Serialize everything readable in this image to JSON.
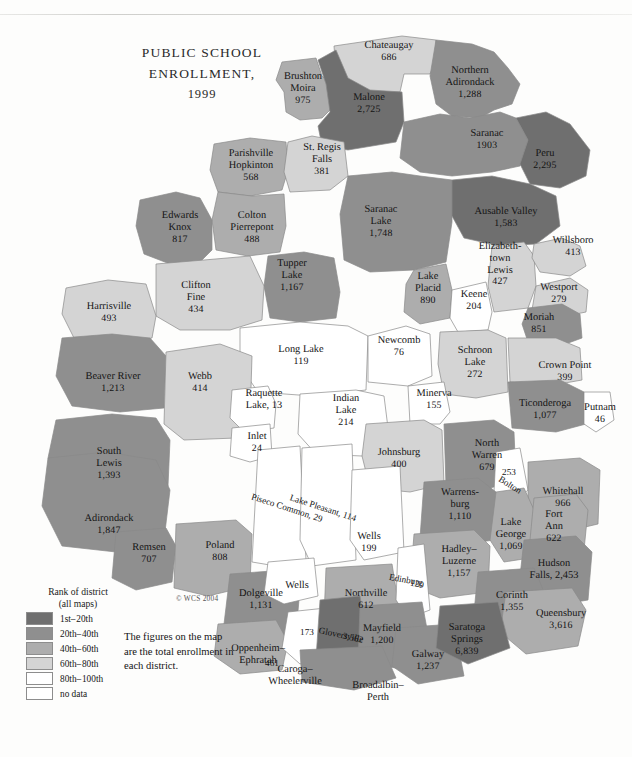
{
  "title": {
    "line1": "PUBLIC SCHOOL",
    "line2": "ENROLLMENT,",
    "line3": "1999"
  },
  "copyright": "© WCS 2004",
  "note": "The figures on the map are the total enrollment in each district.",
  "legend": {
    "title_line1": "Rank of district",
    "title_line2": "(all maps)",
    "items": [
      {
        "label": "1st– 20th",
        "color": "#6f6f6f"
      },
      {
        "label": "20th– 40th",
        "color": "#8f8f8f"
      },
      {
        "label": "40th– 60th",
        "color": "#adadad"
      },
      {
        "label": "60th– 80th",
        "color": "#d4d4d4"
      },
      {
        "label": "80th– 100th",
        "color": "#ffffff"
      },
      {
        "label": "no data",
        "color": "#ffffff"
      }
    ]
  },
  "chart_data": {
    "type": "map",
    "title": "PUBLIC SCHOOL ENROLLMENT, 1999",
    "units": "total enrollment in each district",
    "classes": [
      "1st–20th",
      "20th–40th",
      "40th–60th",
      "60th–80th",
      "80th–100th",
      "no data"
    ],
    "class_colors": [
      "#6f6f6f",
      "#8f8f8f",
      "#adadad",
      "#d4d4d4",
      "#ffffff",
      "#ffffff"
    ],
    "districts": [
      {
        "name": "Chateaugay",
        "value": "686",
        "class": 3
      },
      {
        "name": "Brushton\nMoira",
        "value": "975",
        "class": 2
      },
      {
        "name": "Malone",
        "value": "2,725",
        "class": 0
      },
      {
        "name": "Northern\nAdirondack",
        "value": "1,288",
        "class": 1
      },
      {
        "name": "Saranac",
        "value": "1903",
        "class": 1
      },
      {
        "name": "Peru",
        "value": "2,295",
        "class": 0
      },
      {
        "name": "Parishville\nHopkinton",
        "value": "568",
        "class": 2
      },
      {
        "name": "St. Regis\nFalls",
        "value": "381",
        "class": 3
      },
      {
        "name": "Saranac\nLake",
        "value": "1,748",
        "class": 1
      },
      {
        "name": "Ausable Valley",
        "value": "1,583",
        "class": 0
      },
      {
        "name": "Willsboro",
        "value": "413",
        "class": 3
      },
      {
        "name": "Edwards\nKnox",
        "value": "817",
        "class": 1
      },
      {
        "name": "Colton\nPierrepont",
        "value": "488",
        "class": 2
      },
      {
        "name": "Elizabeth-\ntown\nLewis",
        "value": "427",
        "class": 3
      },
      {
        "name": "Westport",
        "value": "279",
        "class": 3
      },
      {
        "name": "Tupper\nLake",
        "value": "1,167",
        "class": 1
      },
      {
        "name": "Lake\nPlacid",
        "value": "890",
        "class": 2
      },
      {
        "name": "Keene",
        "value": "204",
        "class": 4
      },
      {
        "name": "Harrisville",
        "value": "493",
        "class": 3
      },
      {
        "name": "Clifton\nFine",
        "value": "434",
        "class": 3
      },
      {
        "name": "Moriah",
        "value": "851",
        "class": 1
      },
      {
        "name": "Long Lake",
        "value": "119",
        "class": 4
      },
      {
        "name": "Newcomb",
        "value": "76",
        "class": 4
      },
      {
        "name": "Schroon\nLake",
        "value": "272",
        "class": 3
      },
      {
        "name": "Crown Point",
        "value": "399",
        "class": 3
      },
      {
        "name": "Beaver River",
        "value": "1,213",
        "class": 1
      },
      {
        "name": "Webb",
        "value": "414",
        "class": 3
      },
      {
        "name": "Raquette\nLake, 13",
        "value": "",
        "class": 4
      },
      {
        "name": "Indian\nLake",
        "value": "214",
        "class": 4
      },
      {
        "name": "Minerva",
        "value": "155",
        "class": 4
      },
      {
        "name": "Ticonderoga",
        "value": "1,077",
        "class": 1
      },
      {
        "name": "Putnam",
        "value": "46",
        "class": 4
      },
      {
        "name": "Inlet",
        "value": "24",
        "class": 4
      },
      {
        "name": "South\nLewis",
        "value": "1,393",
        "class": 1
      },
      {
        "name": "Johnsburg",
        "value": "400",
        "class": 3
      },
      {
        "name": "North\nWarren",
        "value": "679",
        "class": 1
      },
      {
        "name": "Bolton",
        "value": "253",
        "class": 4
      },
      {
        "name": "Whitehall",
        "value": "966",
        "class": 2
      },
      {
        "name": "Piseco Common, 29",
        "value": "",
        "class": 4
      },
      {
        "name": "Lake Pleasant, 114",
        "value": "",
        "class": 4
      },
      {
        "name": "Warrens-\nburg",
        "value": "1,110",
        "class": 1
      },
      {
        "name": "Lake\nGeorge",
        "value": "1,069",
        "class": 2
      },
      {
        "name": "Fort\nAnn",
        "value": "622",
        "class": 2
      },
      {
        "name": "Adirondack",
        "value": "1,847",
        "class": 1
      },
      {
        "name": "Remsen",
        "value": "707",
        "class": 1
      },
      {
        "name": "Poland",
        "value": "808",
        "class": 2
      },
      {
        "name": "Wells",
        "value": "199",
        "class": 4
      },
      {
        "name": "Hadley–\nLuzerne",
        "value": "1,157",
        "class": 2
      },
      {
        "name": "Hudson\nFalls, 2,453",
        "value": "",
        "class": 1
      },
      {
        "name": "Wells",
        "value": "",
        "class": 4
      },
      {
        "name": "Dolgeville",
        "value": "1,131",
        "class": 1
      },
      {
        "name": "Northville",
        "value": "612",
        "class": 2
      },
      {
        "name": "Edinburg",
        "value": "120",
        "class": 4
      },
      {
        "name": "Corinth",
        "value": "1,355",
        "class": 1
      },
      {
        "name": "Queensbury",
        "value": "3,616",
        "class": 2
      },
      {
        "name": "Oppenheim–\nEphratah",
        "value": "461",
        "class": 2
      },
      {
        "name": "Caroga–\nWheelerville",
        "value": "173",
        "class": 4
      },
      {
        "name": "Gloversville",
        "value": "3,562",
        "class": 0
      },
      {
        "name": "Mayfield",
        "value": "1,200",
        "class": 1
      },
      {
        "name": "Broadalbin–\nPerth",
        "value": "1,872",
        "class": 1
      },
      {
        "name": "Galway",
        "value": "1,237",
        "class": 1
      },
      {
        "name": "Saratoga\nSprings",
        "value": "6,839",
        "class": 0
      }
    ]
  },
  "labels": [
    {
      "name": "chateaugay",
      "x": 389,
      "y": 52,
      "t": "Chateaugay",
      "n": "686"
    },
    {
      "name": "brushton-moira",
      "x": 303,
      "y": 89,
      "t": "Brushton\nMoira",
      "n": "975"
    },
    {
      "name": "malone",
      "x": 369,
      "y": 104,
      "t": "Malone",
      "n": "2,725"
    },
    {
      "name": "northern-adirondack",
      "x": 470,
      "y": 83,
      "t": "Northern\nAdirondack",
      "n": "1,288"
    },
    {
      "name": "saranac",
      "x": 487,
      "y": 140,
      "t": "Saranac",
      "n": "1903"
    },
    {
      "name": "peru",
      "x": 545,
      "y": 160,
      "t": "Peru",
      "n": "2,295"
    },
    {
      "name": "parishville-hopkinton",
      "x": 251,
      "y": 166,
      "t": "Parishville\nHopkinton",
      "n": "568"
    },
    {
      "name": "st-regis-falls",
      "x": 322,
      "y": 160,
      "t": "St. Regis\nFalls",
      "n": "381"
    },
    {
      "name": "edwards-knox",
      "x": 180,
      "y": 228,
      "t": "Edwards\nKnox",
      "n": "817"
    },
    {
      "name": "colton-pierrepont",
      "x": 252,
      "y": 228,
      "t": "Colton\nPierrepont",
      "n": "488"
    },
    {
      "name": "saranac-lake",
      "x": 381,
      "y": 222,
      "t": "Saranac\nLake",
      "n": "1,748"
    },
    {
      "name": "ausable-valley",
      "x": 506,
      "y": 218,
      "t": "Ausable Valley",
      "n": "1,583"
    },
    {
      "name": "willsboro",
      "x": 573,
      "y": 247,
      "t": "Willsboro",
      "n": "413"
    },
    {
      "name": "elizabethtown-lewis",
      "x": 500,
      "y": 265,
      "t": "Elizabeth-\ntown\nLewis",
      "n": "427"
    },
    {
      "name": "westport",
      "x": 559,
      "y": 294,
      "t": "Westport",
      "n": "279"
    },
    {
      "name": "tupper-lake",
      "x": 292,
      "y": 276,
      "t": "Tupper\nLake",
      "n": "1,167"
    },
    {
      "name": "lake-placid",
      "x": 428,
      "y": 289,
      "t": "Lake\nPlacid",
      "n": "890"
    },
    {
      "name": "keene",
      "x": 474,
      "y": 301,
      "t": "Keene",
      "n": "204"
    },
    {
      "name": "harrisville",
      "x": 109,
      "y": 313,
      "t": "Harrisville",
      "n": "493"
    },
    {
      "name": "clifton-fine",
      "x": 196,
      "y": 298,
      "t": "Clifton\nFine",
      "n": "434"
    },
    {
      "name": "moriah",
      "x": 539,
      "y": 324,
      "t": "Moriah",
      "n": "851"
    },
    {
      "name": "long-lake",
      "x": 301,
      "y": 356,
      "t": "Long Lake",
      "n": "119"
    },
    {
      "name": "newcomb",
      "x": 399,
      "y": 347,
      "t": "Newcomb",
      "n": "76"
    },
    {
      "name": "schroon-lake",
      "x": 475,
      "y": 363,
      "t": "Schroon\nLake",
      "n": "272"
    },
    {
      "name": "crown-point",
      "x": 565,
      "y": 372,
      "t": "Crown Point",
      "n": "399"
    },
    {
      "name": "beaver-river",
      "x": 113,
      "y": 383,
      "t": "Beaver River",
      "n": "1,213"
    },
    {
      "name": "webb",
      "x": 200,
      "y": 383,
      "t": "Webb",
      "n": "414"
    },
    {
      "name": "raquette-lake",
      "x": 264,
      "y": 400,
      "t": "Raquette\nLake, 13",
      "n": ""
    },
    {
      "name": "indian-lake",
      "x": 346,
      "y": 411,
      "t": "Indian\nLake",
      "n": "214"
    },
    {
      "name": "minerva",
      "x": 434,
      "y": 400,
      "t": "Minerva",
      "n": "155"
    },
    {
      "name": "ticonderoga",
      "x": 545,
      "y": 410,
      "t": "Ticonderoga",
      "n": "1,077"
    },
    {
      "name": "putnam",
      "x": 600,
      "y": 414,
      "t": "Putnam",
      "n": "46"
    },
    {
      "name": "inlet",
      "x": 257,
      "y": 443,
      "t": "Inlet",
      "n": "24"
    },
    {
      "name": "south-lewis",
      "x": 109,
      "y": 464,
      "t": "South\nLewis",
      "n": "1,393"
    },
    {
      "name": "johnsburg",
      "x": 399,
      "y": 459,
      "t": "Johnsburg",
      "n": "400"
    },
    {
      "name": "north-warren",
      "x": 487,
      "y": 456,
      "t": "North\nWarren",
      "n": "679"
    },
    {
      "name": "whitehall",
      "x": 563,
      "y": 498,
      "t": "Whitehall",
      "n": "966"
    },
    {
      "name": "warrensburg",
      "x": 460,
      "y": 505,
      "t": "Warrens-\nburg",
      "n": "1,110"
    },
    {
      "name": "lake-george",
      "x": 511,
      "y": 535,
      "t": "Lake\nGeorge",
      "n": "1,069"
    },
    {
      "name": "fort-ann",
      "x": 554,
      "y": 527,
      "t": "Fort\nAnn",
      "n": "622"
    },
    {
      "name": "adirondack",
      "x": 109,
      "y": 525,
      "t": "Adirondack",
      "n": "1,847"
    },
    {
      "name": "remsen",
      "x": 149,
      "y": 554,
      "t": "Remsen",
      "n": "707"
    },
    {
      "name": "poland",
      "x": 220,
      "y": 552,
      "t": "Poland",
      "n": "808"
    },
    {
      "name": "wells-upper",
      "x": 369,
      "y": 543,
      "t": "Wells",
      "n": "199"
    },
    {
      "name": "hadley-luzerne",
      "x": 459,
      "y": 562,
      "t": "Hadley–\nLuzerne",
      "n": "1,157"
    },
    {
      "name": "hudson-falls",
      "x": 554,
      "y": 570,
      "t": "Hudson\nFalls, 2,453",
      "n": ""
    },
    {
      "name": "wells-lower",
      "x": 297,
      "y": 586,
      "t": "Wells",
      "n": ""
    },
    {
      "name": "dolgeville",
      "x": 261,
      "y": 600,
      "t": "Dolgeville",
      "n": "1,131"
    },
    {
      "name": "northville",
      "x": 366,
      "y": 600,
      "t": "Northville",
      "n": "612"
    },
    {
      "name": "corinth",
      "x": 512,
      "y": 602,
      "t": "Corinth",
      "n": "1,355"
    },
    {
      "name": "queensbury",
      "x": 561,
      "y": 620,
      "t": "Queensbury",
      "n": "3,616"
    },
    {
      "name": "oppenheim-ephratah",
      "x": 258,
      "y": 655,
      "t": "Oppenheim–\nEphratah",
      "n": ""
    },
    {
      "name": "caroga-wheelerville",
      "x": 295,
      "y": 676,
      "t": "Caroga–\nWheelerville",
      "n": ""
    },
    {
      "name": "mayfield",
      "x": 382,
      "y": 635,
      "t": "Mayfield",
      "n": "1,200"
    },
    {
      "name": "broadalbin-perth",
      "x": 378,
      "y": 692,
      "t": "Broadalbin–\nPerth",
      "n": ""
    },
    {
      "name": "galway",
      "x": 428,
      "y": 661,
      "t": "Galway",
      "n": "1,237"
    },
    {
      "name": "saratoga-springs",
      "x": 467,
      "y": 640,
      "t": "Saratoga\nSprings",
      "n": "6,839"
    }
  ],
  "labels_plain": [
    {
      "name": "caroga-number",
      "x": 307,
      "y": 632,
      "t": "173"
    },
    {
      "name": "oppenheim-number",
      "x": 272,
      "y": 663,
      "t": "461"
    },
    {
      "name": "bolton-number",
      "x": 509,
      "y": 472,
      "t": "253"
    }
  ],
  "labels_rot": [
    {
      "name": "piseco-common",
      "x": 287,
      "y": 508,
      "t": "Piseco Common, 29",
      "rot": -72
    },
    {
      "name": "lake-pleasant",
      "x": 323,
      "y": 508,
      "t": "Lake Pleasant, 114",
      "rot": -72
    },
    {
      "name": "bolton",
      "x": 510,
      "y": 485,
      "t": "Bolton",
      "rot": -58
    },
    {
      "name": "gloversville",
      "x": 341,
      "y": 635,
      "t": "Gloversville",
      "rot": -78
    },
    {
      "name": "gloversville-number",
      "x": 353,
      "y": 638,
      "t": "3,562",
      "rot": -78
    },
    {
      "name": "edinburg",
      "x": 406,
      "y": 580,
      "t": "Edinburg",
      "rot": -80
    },
    {
      "name": "edinburg-number",
      "x": 417,
      "y": 584,
      "t": "120",
      "rot": -80
    }
  ]
}
